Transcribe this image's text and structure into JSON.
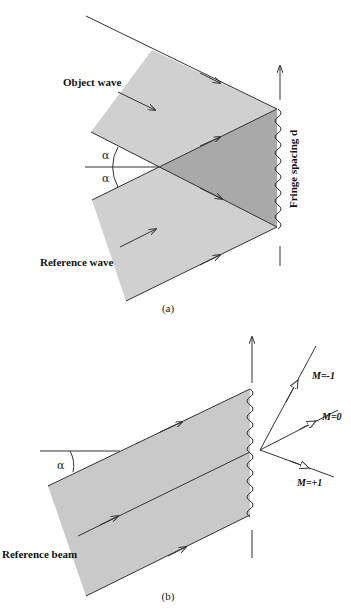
{
  "colors": {
    "beam_fill": "#d0d0d0",
    "overlap_fill": "#a9a9a9",
    "beam_b_fill": "#c9c9c9",
    "line": "#333333",
    "background": "#ffffff"
  },
  "figure_a": {
    "caption": "(a)",
    "object_wave_label": "Object wave",
    "reference_wave_label": "Reference wave",
    "fringe_label": "Fringe spacing d",
    "angle_top": "α",
    "angle_bottom": "α"
  },
  "figure_b": {
    "caption": "(b)",
    "reference_beam_label": "Reference beam",
    "angle": "α",
    "orders": [
      {
        "label": "M=-1"
      },
      {
        "label": "M=0"
      },
      {
        "label": "M=+1"
      }
    ]
  }
}
